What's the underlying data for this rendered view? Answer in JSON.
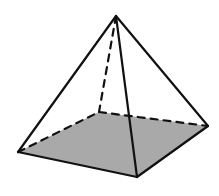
{
  "diagram": {
    "type": "square-pyramid",
    "colors": {
      "background": "#ffffff",
      "edge": "#111111",
      "base_fill": "#a9a9a9"
    },
    "vertices": {
      "apex": [
        116,
        16
      ],
      "base_left": [
        18,
        152
      ],
      "base_front": [
        137,
        177
      ],
      "base_right": [
        208,
        126
      ],
      "base_back_hidden": [
        99,
        112
      ]
    },
    "solid_edges": [
      [
        "apex",
        "base_left"
      ],
      [
        "apex",
        "base_front"
      ],
      [
        "apex",
        "base_right"
      ],
      [
        "base_left",
        "base_front"
      ],
      [
        "base_front",
        "base_right"
      ]
    ],
    "hidden_edges": [
      [
        "apex",
        "base_back_hidden"
      ],
      [
        "base_left",
        "base_back_hidden"
      ],
      [
        "base_back_hidden",
        "base_right"
      ]
    ]
  }
}
